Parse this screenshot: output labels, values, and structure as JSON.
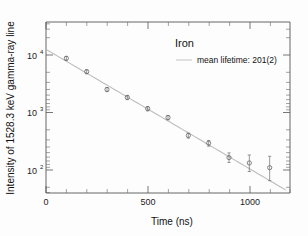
{
  "chart_data": {
    "type": "scatter",
    "title": "",
    "xlabel": "Time (ns)",
    "ylabel": "Intensity of 1528.3 keV gamma-ray line",
    "yscale": "log",
    "xlim": [
      0,
      1200
    ],
    "ylim": [
      40,
      50000
    ],
    "grid": false,
    "xticks": [
      0,
      500,
      1000
    ],
    "xticklabels": [
      "0",
      "500",
      "1000"
    ],
    "xminorticks": [
      100,
      200,
      300,
      400,
      600,
      700,
      800,
      900,
      1100,
      1200
    ],
    "yticks": [
      100,
      1000,
      10000
    ],
    "yticklabels": [
      "10",
      "10",
      "10"
    ],
    "yticksuperscripts": [
      "2",
      "3",
      "4"
    ],
    "legend_position": "upper-right",
    "series": [
      {
        "name": "Iron",
        "marker": "open-circle",
        "x": [
          100,
          200,
          300,
          400,
          500,
          600,
          700,
          800,
          900,
          1000,
          1100
        ],
        "y": [
          11000,
          6300,
          3000,
          2150,
          1350,
          930,
          440,
          320,
          175,
          140,
          115
        ],
        "yerr_low": [
          900,
          520,
          260,
          190,
          120,
          85,
          45,
          38,
          32,
          42,
          48
        ],
        "yerr_high": [
          900,
          520,
          260,
          190,
          120,
          85,
          45,
          38,
          38,
          55,
          70
        ]
      },
      {
        "name": "mean lifetime: 201(2)",
        "type": "line",
        "fit": "exponential",
        "amplitude": 16000,
        "lifetime_ns": 201,
        "x_range": [
          0,
          1180
        ],
        "color": "#bdbdbd"
      }
    ],
    "annotations": [
      {
        "text": "Iron",
        "role": "legend-title"
      },
      {
        "text": "mean lifetime: 201(2)",
        "role": "legend-entry"
      }
    ]
  },
  "legend": {
    "title": "Iron",
    "entry_label": "mean lifetime: 201(2)"
  },
  "axes": {
    "x_title": "Time (ns)",
    "y_title": "Intensity of 1528.3 keV gamma-ray line",
    "x_labels": [
      "0",
      "500",
      "1000"
    ],
    "y_label_mantissa": "10",
    "y_label_exponents": [
      "2",
      "3",
      "4"
    ]
  }
}
